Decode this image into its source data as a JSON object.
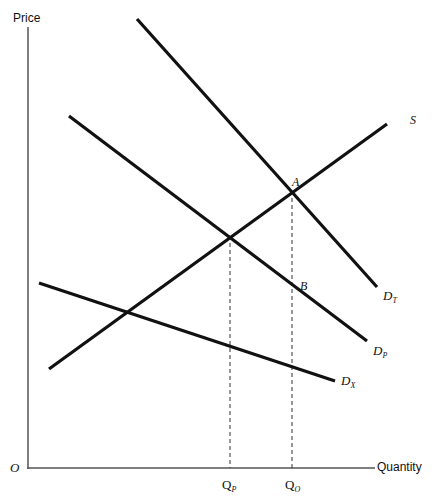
{
  "chart_data": {
    "type": "line",
    "title": "",
    "xlabel": "Quantity",
    "ylabel": "Price",
    "origin_label": "O",
    "grid": false,
    "legend": null,
    "series": [
      {
        "name": "S",
        "label": "S",
        "subscript": "",
        "points": [
          [
            49,
            369
          ],
          [
            387,
            124
          ]
        ],
        "role": "supply"
      },
      {
        "name": "D_T",
        "label": "D",
        "subscript": "T",
        "points": [
          [
            137,
            19
          ],
          [
            377,
            287
          ]
        ],
        "role": "total demand"
      },
      {
        "name": "D_P",
        "label": "D",
        "subscript": "P",
        "points": [
          [
            69,
            116
          ],
          [
            367,
            341
          ]
        ],
        "role": "private demand"
      },
      {
        "name": "D_X",
        "label": "D",
        "subscript": "X",
        "points": [
          [
            39,
            283
          ],
          [
            335,
            381
          ]
        ],
        "role": "external demand"
      }
    ],
    "points": [
      {
        "name": "A",
        "label": "A",
        "x": 292,
        "y": 198
      },
      {
        "name": "B",
        "label": "B",
        "x": 292,
        "y": 291
      }
    ],
    "x_ticks": [
      {
        "label": "Q",
        "subscript": "P",
        "x": 229
      },
      {
        "label": "Q",
        "subscript": "O",
        "x": 292
      }
    ],
    "dashed_lines": [
      {
        "from": [
          230,
          243
        ],
        "to": [
          230,
          468
        ]
      },
      {
        "from": [
          292,
          198
        ],
        "to": [
          292,
          468
        ]
      }
    ],
    "axes": {
      "x_axis": {
        "from": [
          28,
          468
        ],
        "to": [
          375,
          468
        ]
      },
      "y_axis": {
        "from": [
          28,
          27
        ],
        "to": [
          28,
          468
        ]
      }
    }
  },
  "labels": {
    "price": "Price",
    "quantity": "Quantity",
    "origin": "O",
    "S": "S",
    "A": "A",
    "B": "B",
    "DT_main": "D",
    "DT_sub": "T",
    "DP_main": "D",
    "DP_sub": "P",
    "DX_main": "D",
    "DX_sub": "X",
    "QP_main": "Q",
    "QP_sub": "P",
    "QO_main": "Q",
    "QO_sub": "O"
  }
}
